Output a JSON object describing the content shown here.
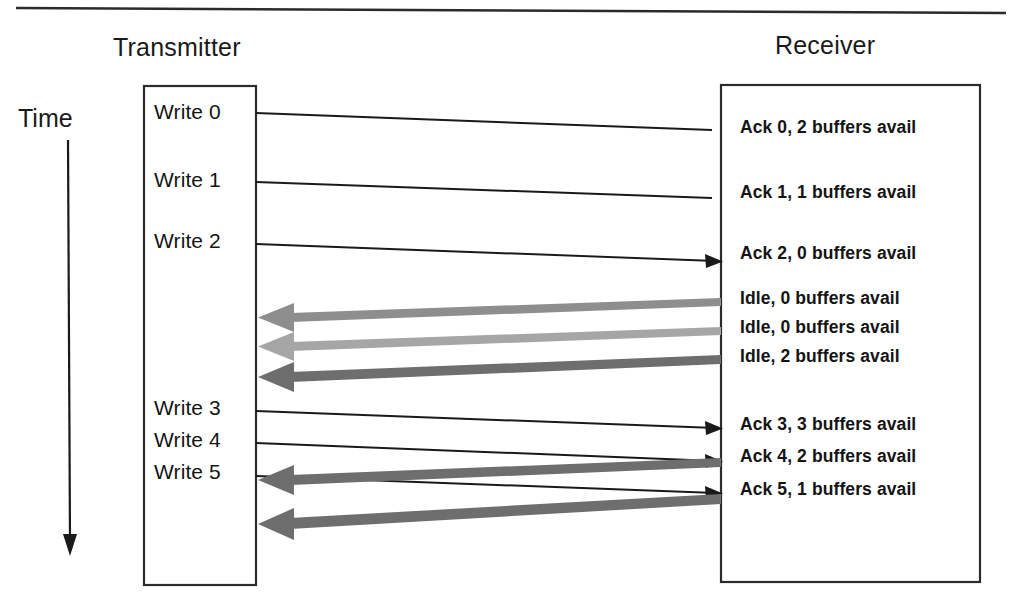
{
  "diagram": {
    "type": "sequence-diagram",
    "topic": "Sliding window flow control with buffer credits",
    "time_axis_label": "Time",
    "columns": [
      {
        "id": "transmitter",
        "title": "Transmitter"
      },
      {
        "id": "receiver",
        "title": "Receiver"
      }
    ],
    "transmitter_events": [
      {
        "id": "write-0",
        "label": "Write 0",
        "y": 113
      },
      {
        "id": "write-1",
        "label": "Write 1",
        "y": 180
      },
      {
        "id": "write-2",
        "label": "Write 2",
        "y": 241
      },
      {
        "id": "write-3",
        "label": "Write 3",
        "y": 408
      },
      {
        "id": "write-4",
        "label": "Write 4",
        "y": 440
      },
      {
        "id": "write-5",
        "label": "Write 5",
        "y": 472
      }
    ],
    "receiver_events": [
      {
        "id": "ack-0",
        "label": "Ack 0, 2 buffers avail",
        "y": 128
      },
      {
        "id": "ack-1",
        "label": "Ack 1, 1 buffers avail",
        "y": 193
      },
      {
        "id": "ack-2",
        "label": "Ack 2, 0 buffers avail",
        "y": 254
      },
      {
        "id": "idle-0",
        "label": "Idle, 0 buffers avail",
        "y": 299
      },
      {
        "id": "idle-1",
        "label": "Idle, 0 buffers avail",
        "y": 328
      },
      {
        "id": "idle-2",
        "label": "Idle, 2 buffers avail",
        "y": 357
      },
      {
        "id": "ack-3",
        "label": "Ack 3, 3 buffers avail",
        "y": 425
      },
      {
        "id": "ack-4",
        "label": "Ack 4, 2 buffers avail",
        "y": 457
      },
      {
        "id": "ack-5",
        "label": "Ack 5, 1 buffers avail",
        "y": 490
      }
    ],
    "messages_to_receiver": [
      {
        "from": "write-0",
        "to": "ack-0",
        "y1": 113,
        "y2": 130,
        "arrowhead": false,
        "color": "#1a1a1a"
      },
      {
        "from": "write-1",
        "to": "ack-1",
        "y1": 182,
        "y2": 198,
        "arrowhead": false,
        "color": "#1a1a1a"
      },
      {
        "from": "write-2",
        "to": "ack-2",
        "y1": 244,
        "y2": 261,
        "arrowhead": true,
        "color": "#1a1a1a"
      },
      {
        "from": "write-3",
        "to": "ack-3",
        "y1": 411,
        "y2": 428,
        "arrowhead": true,
        "color": "#1a1a1a"
      },
      {
        "from": "write-4",
        "to": "ack-4",
        "y1": 443,
        "y2": 461,
        "arrowhead": true,
        "color": "#1a1a1a"
      },
      {
        "from": "write-5",
        "to": "ack-5",
        "y1": 476,
        "y2": 493,
        "arrowhead": true,
        "color": "#1a1a1a"
      }
    ],
    "messages_to_transmitter": [
      {
        "from": "idle-0",
        "y1": 300,
        "y2": 320,
        "color": "#8e8e8e"
      },
      {
        "from": "idle-1",
        "y1": 330,
        "y2": 350,
        "color": "#a6a6a6"
      },
      {
        "from": "idle-2",
        "y1": 359,
        "y2": 381,
        "color": "#6e6e6e"
      },
      {
        "from": "ack-3",
        "y1": 462,
        "y2": 484,
        "color": "#6e6e6e"
      },
      {
        "from": "ack-5",
        "y1": 498,
        "y2": 528,
        "color": "#6e6e6e"
      }
    ],
    "colors": {
      "stroke": "#1a1a1a",
      "gray_light": "#a6a6a6",
      "gray_mid": "#8e8e8e",
      "gray_dark": "#6e6e6e",
      "background": "#ffffff"
    }
  }
}
